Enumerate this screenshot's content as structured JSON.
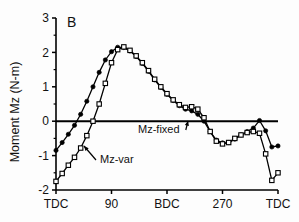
{
  "figure": {
    "panel_label": "B",
    "background_color": "#fdfdfd",
    "line_color": "#000000"
  },
  "chart_data": {
    "type": "line",
    "title": "",
    "subtitle": "",
    "panel": "B",
    "xlabel": "",
    "ylabel": "Moment Mz (N-m)",
    "xlim": [
      0,
      720
    ],
    "ylim": [
      -2,
      3
    ],
    "yticks": [
      -2,
      -1,
      0,
      1,
      2,
      3
    ],
    "ytick_labels": [
      "-2",
      "-1",
      "0",
      "1",
      "2",
      "3"
    ],
    "y_minor_ticks": [
      -1.5,
      -0.5,
      0.5,
      1.5,
      2.5
    ],
    "xticks": [
      0,
      180,
      360,
      540,
      720
    ],
    "xtick_labels": [
      "TDC",
      "90",
      "BDC",
      "270",
      "TDC"
    ],
    "grid": false,
    "zero_line": true,
    "legend_position": "inline-annotations",
    "annotations": [
      {
        "text": "Mz-var",
        "x_px": 100,
        "y_px": 163,
        "arrow_to_x_px": 84,
        "arrow_to_y_px": 146
      },
      {
        "text": "Mz-fixed",
        "x_px": 138,
        "y_px": 133,
        "arrow_to_x_px": 188,
        "arrow_to_y_px": 121
      }
    ],
    "series": [
      {
        "name": "Mz-fixed",
        "marker": "filled-circle",
        "x": [
          0,
          20,
          40,
          60,
          80,
          100,
          120,
          140,
          160,
          180,
          200,
          220,
          240,
          260,
          280,
          300,
          320,
          340,
          360,
          380,
          400,
          420,
          440,
          460,
          480,
          500,
          520,
          540,
          560,
          580,
          600,
          620,
          640,
          660,
          680,
          700,
          720
        ],
        "values": [
          -0.85,
          -0.62,
          -0.38,
          -0.12,
          0.2,
          0.58,
          1.0,
          1.42,
          1.78,
          2.02,
          2.15,
          2.14,
          2.04,
          1.88,
          1.68,
          1.45,
          1.2,
          0.98,
          0.78,
          0.6,
          0.45,
          0.35,
          0.3,
          0.2,
          0.0,
          -0.3,
          -0.55,
          -0.63,
          -0.62,
          -0.52,
          -0.4,
          -0.3,
          -0.2,
          0.02,
          -0.28,
          -0.75,
          -0.72
        ]
      },
      {
        "name": "Mz-var",
        "marker": "open-square",
        "x": [
          0,
          20,
          40,
          60,
          80,
          100,
          120,
          140,
          160,
          180,
          200,
          220,
          240,
          260,
          280,
          300,
          320,
          340,
          360,
          380,
          400,
          420,
          440,
          460,
          480,
          500,
          520,
          540,
          560,
          580,
          600,
          620,
          640,
          660,
          680,
          700,
          720
        ],
        "values": [
          -1.75,
          -1.52,
          -1.28,
          -1.05,
          -0.78,
          -0.42,
          0.0,
          0.5,
          1.1,
          1.7,
          2.08,
          2.16,
          2.06,
          1.9,
          1.7,
          1.47,
          1.22,
          1.0,
          0.8,
          0.62,
          0.48,
          0.4,
          0.42,
          0.35,
          0.1,
          -0.3,
          -0.58,
          -0.66,
          -0.62,
          -0.5,
          -0.4,
          -0.33,
          -0.3,
          -0.35,
          -0.95,
          -1.72,
          -1.5
        ]
      }
    ]
  }
}
